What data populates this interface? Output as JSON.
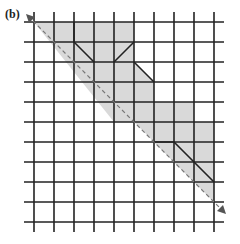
{
  "figure": {
    "label": "(b)",
    "grid": {
      "vertical_lines_x": [
        34,
        54,
        74,
        94,
        114,
        134,
        154,
        174,
        194,
        214
      ],
      "horizontal_lines_y": [
        22,
        42,
        62,
        82,
        102,
        122,
        142,
        162,
        182,
        202,
        222
      ],
      "line_color": "#222222"
    },
    "shaded_region": {
      "fill": "#d9d9d9",
      "outline_color": "#222222"
    },
    "diagonal_arrow": {
      "style": "dashed",
      "color": "#777777",
      "from": [
        26,
        14
      ],
      "to": [
        226,
        214
      ]
    }
  }
}
